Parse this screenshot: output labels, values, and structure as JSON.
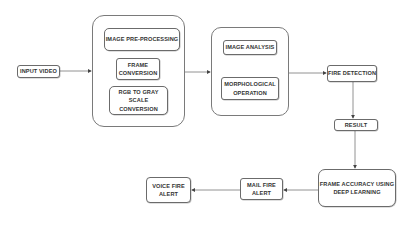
{
  "diagram": {
    "nodes": {
      "input_video": "INPUT VIDEO",
      "image_preprocessing": "IMAGE PRE-PROCESSING",
      "frame_conversion_1": "FRAME",
      "frame_conversion_2": "CONVERSION",
      "rgb_to_gray_1": "RGB TO GRAY SCALE",
      "rgb_to_gray_2": "CONVERSION",
      "image_analysis": "IMAGE ANALYSIS",
      "morphological_1": "MORPHOLOGICAL",
      "morphological_2": "OPERATION",
      "fire_detection": "FIRE DETECTION",
      "result": "RESULT",
      "frame_accuracy_1": "FRAME ACCURACY USING",
      "frame_accuracy_2": "DEEP LEARNING",
      "mail_fire_alert_1": "MAIL FIRE",
      "mail_fire_alert_2": "ALERT",
      "voice_fire_alert_1": "VOICE FIRE",
      "voice_fire_alert_2": "ALERT"
    },
    "groups": [
      "preprocessing-group",
      "analysis-group"
    ],
    "edges": [
      {
        "from": "input_video",
        "to": "preprocessing-group"
      },
      {
        "from": "preprocessing-group",
        "to": "analysis-group"
      },
      {
        "from": "analysis-group",
        "to": "fire_detection"
      },
      {
        "from": "fire_detection",
        "to": "result"
      },
      {
        "from": "result",
        "to": "frame_accuracy"
      },
      {
        "from": "frame_accuracy",
        "to": "mail_fire_alert"
      },
      {
        "from": "mail_fire_alert",
        "to": "voice_fire_alert"
      }
    ],
    "colors": {
      "stroke": "#6b6b6b",
      "text": "#333333",
      "background": "#ffffff"
    }
  }
}
